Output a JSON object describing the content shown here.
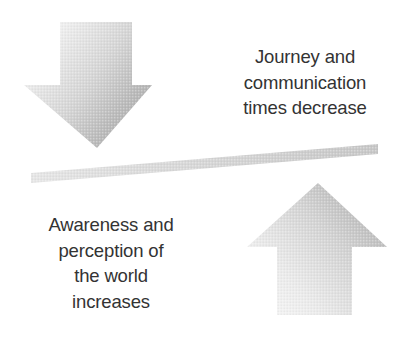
{
  "diagram": {
    "type": "conceptual-seesaw-diagram",
    "background_color": "#ffffff",
    "width": 398,
    "height": 339,
    "captions": {
      "top_right": "Journey and\ncommunication\ntimes decrease",
      "top_right_lines": [
        "Journey and",
        "communication",
        "times decrease"
      ],
      "bottom_left": "Awareness and\nperception of\nthe world\nincreases",
      "bottom_left_lines": [
        "Awareness and",
        "perception of",
        "the world",
        "increases"
      ],
      "text_color": "#333333"
    },
    "shapes": {
      "down_arrow": {
        "name": "down-arrow",
        "direction": "down",
        "meaning": "decrease",
        "gradient_light": "#f2f2f2",
        "gradient_dark": "#aeaeae"
      },
      "up_arrow": {
        "name": "up-arrow",
        "direction": "up",
        "meaning": "increase",
        "gradient_light": "#f2f2f2",
        "gradient_dark": "#aeaeae"
      },
      "balance_bar": {
        "name": "balance-bar",
        "orientation": "tilted-up-to-the-right",
        "tilt_degrees": -4.6,
        "color_light": "#e4e4e4",
        "color_dark": "#c9c9c9"
      }
    }
  }
}
